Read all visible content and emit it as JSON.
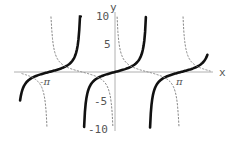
{
  "chart_data": {
    "type": "line",
    "title": "",
    "xlabel": "x",
    "ylabel": "y",
    "xlim": [
      -4.55,
      4.55
    ],
    "ylim": [
      -10,
      10
    ],
    "grid": false,
    "legend": null,
    "x_tick_labels": [
      {
        "label": "-π",
        "value": -3.14159
      },
      {
        "label": "π",
        "value": 3.14159
      }
    ],
    "y_tick_labels": [
      {
        "label": "10",
        "value": 10
      },
      {
        "label": "5",
        "value": 5
      },
      {
        "label": "-5",
        "value": -5
      },
      {
        "label": "-10",
        "value": -10
      }
    ],
    "series": [
      {
        "name": "tan x",
        "function": "tan",
        "style": "solid",
        "color": "#111111",
        "branches": [
          [
            -4.52,
            -1.63
          ],
          [
            -1.47,
            1.47
          ],
          [
            1.67,
            4.4
          ]
        ]
      },
      {
        "name": "cot x",
        "function": "cot",
        "style": "dashed",
        "color": "#888888",
        "branches": [
          [
            -4.45,
            -3.24
          ],
          [
            -3.05,
            -0.1
          ],
          [
            0.1,
            3.05
          ],
          [
            3.24,
            4.55
          ]
        ]
      }
    ]
  },
  "labels": {
    "x_axis": "x",
    "y_axis": "y",
    "neg_pi": "-π",
    "pos_pi": "π",
    "y10": "10",
    "y5": "5",
    "yneg5": "-5",
    "yneg10": "-10"
  }
}
